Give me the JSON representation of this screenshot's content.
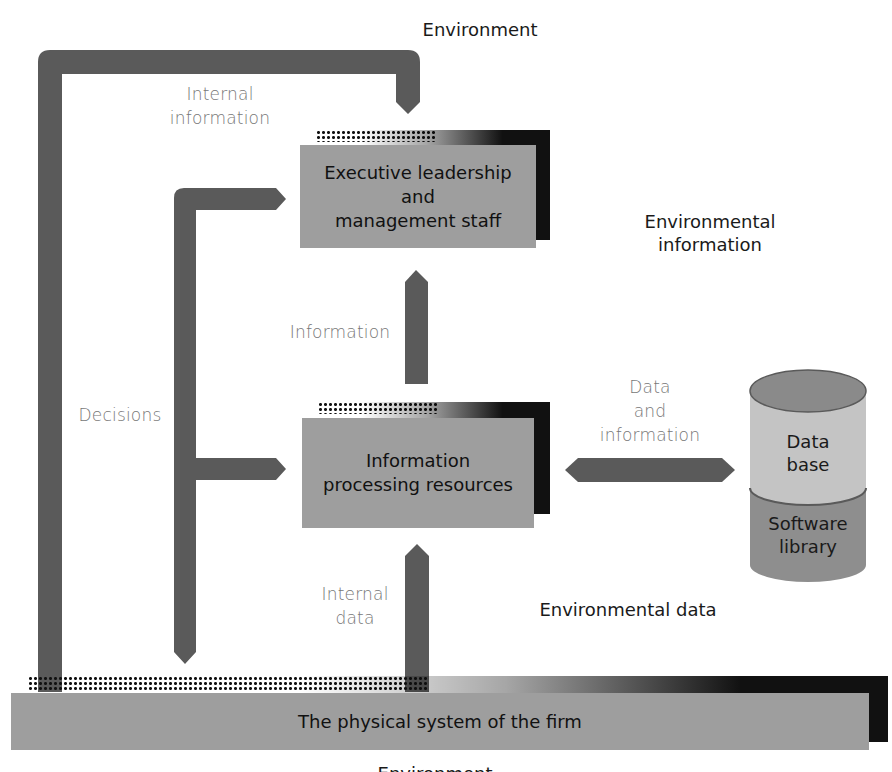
{
  "diagram": {
    "title_top": "Environment",
    "title_bottom": "Environment",
    "nodes": {
      "executive": "Executive leadership\nand\nmanagement staff",
      "executive_lines": [
        "Executive leadership",
        "and",
        "management staff"
      ],
      "processing_lines": [
        "Information",
        "processing resources"
      ],
      "physical_system": "The physical system of the firm",
      "database_lines": [
        "Data",
        "base"
      ],
      "software_lines": [
        "Software",
        "library"
      ]
    },
    "flow_labels": {
      "internal_information": [
        "Internal",
        "information"
      ],
      "environmental_information": [
        "Environmental",
        "information"
      ],
      "information": "Information",
      "decisions": "Decisions",
      "data_and_information": [
        "Data",
        "and",
        "information"
      ],
      "internal_data": [
        "Internal",
        "data"
      ],
      "environmental_data": "Environmental data"
    },
    "colors": {
      "arrow": "#5a5a5a",
      "box": "#9e9e9e",
      "shadow": "#111111",
      "cylinder_top": "#8a8a8a",
      "cylinder_database": "#c4c4c4",
      "cylinder_software": "#8e8e8e",
      "light_label": "#777777"
    }
  }
}
